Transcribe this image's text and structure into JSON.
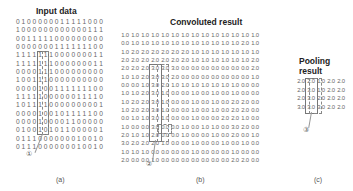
{
  "panels": {
    "a": {
      "title": "Input data",
      "caption": "(a)",
      "marker": "①",
      "rows": [
        "0100000011111000",
        "1000000000000111",
        "0011111000000000",
        "0000000111111100",
        "1111111000000011",
        "1111111000000011",
        "0000111000000000",
        "1001110000000000",
        "0000100111111100",
        "1111100000011110",
        "1011110000000001",
        "0000100101111100",
        "0000100001100000",
        "0100101011000001",
        "0111000000010010",
        "0111000000010010"
      ]
    },
    "b": {
      "title": "Convoluted result",
      "caption": "(b)",
      "marker": "②",
      "rows": [
        [
          "1.0",
          "1.0",
          "1.0",
          "1.0",
          "1.0",
          "1.0",
          "1.0",
          "1.0",
          "1.0",
          "1.0",
          "1.0",
          "1.0",
          "1.0",
          "1.0"
        ],
        [
          "0.0",
          "1.0",
          "1.0",
          "1.0",
          "1.0",
          "1.0",
          "1.0",
          "1.0",
          "1.0",
          "1.0",
          "1.0",
          "1.0",
          "2.0",
          "1.0"
        ],
        [
          "1.0",
          "2.0",
          "2.0",
          "2.0",
          "2.0",
          "2.0",
          "2.0",
          "1.0",
          "1.0",
          "1.0",
          "1.0",
          "1.0",
          "1.0",
          "1.0"
        ],
        [
          "2.0",
          "2.0",
          "2.0",
          "2.0",
          "2.0",
          "2.0",
          "2.0",
          "1.0",
          "1.0",
          "1.0",
          "1.0",
          "1.0",
          "1.0",
          "2.0"
        ],
        [
          "2.0",
          "2.0",
          "2.0",
          "3.0",
          "3.0",
          "3.0",
          "0.0",
          "0.0",
          "0.0",
          "0.0",
          "0.0",
          "0.0",
          "0.0",
          "2.0"
        ],
        [
          "1.0",
          "1.0",
          "2.0",
          "3.0",
          "3.0",
          "2.0",
          "0.0",
          "0.0",
          "0.0",
          "0.0",
          "0.0",
          "0.0",
          "0.0",
          "1.0"
        ],
        [
          "0.0",
          "0.0",
          "1.0",
          "3.0",
          "2.0",
          "1.0",
          "1.0",
          "1.0",
          "1.0",
          "1.0",
          "1.0",
          "1.0",
          "0.0",
          "0.0"
        ],
        [
          "1.0",
          "1.0",
          "2.0",
          "3.0",
          "1.0",
          "0.0",
          "0.0",
          "1.0",
          "0.0",
          "1.0",
          "0.0",
          "1.0",
          "0.0",
          "0.0"
        ],
        [
          "1.0",
          "2.0",
          "2.0",
          "3.0",
          "1.0",
          "0.0",
          "0.0",
          "1.0",
          "0.0",
          "1.0",
          "0.0",
          "2.0",
          "2.0",
          "0.0"
        ],
        [
          "1.0",
          "2.0",
          "2.0",
          "3.0",
          "1.0",
          "0.0",
          "0.0",
          "1.0",
          "0.0",
          "1.0",
          "0.0",
          "2.0",
          "2.0",
          "0.0"
        ],
        [
          "0.0",
          "1.0",
          "1.0",
          "3.0",
          "1.0",
          "0.0",
          "0.0",
          "1.0",
          "0.0",
          "0.0",
          "2.0",
          "2.0",
          "1.0",
          "0.0"
        ],
        [
          "1.0",
          "0.0",
          "0.0",
          "3.0",
          "0.0",
          "0.0",
          "1.0",
          "0.0",
          "1.0",
          "1.0",
          "0.0",
          "3.0",
          "2.0",
          "0.0"
        ],
        [
          "2.0",
          "1.0",
          "1.0",
          "2.0",
          "0.0",
          "0.0",
          "1.0",
          "0.0",
          "0.0",
          "1.0",
          "0.0",
          "2.0",
          "0.0",
          "1.0"
        ],
        [
          "3.0",
          "2.0",
          "2.0",
          "2.0",
          "1.0",
          "0.0",
          "0.0",
          "1.0",
          "0.0",
          "0.0",
          "1.0",
          "0.0",
          "1.0",
          "0.0"
        ],
        [
          "1.0",
          "1.0",
          "1.0",
          "0.0",
          "0.0",
          "0.0",
          "0.0",
          "1.0",
          "0.0",
          "0.0",
          "0.0",
          "1.0",
          "0.0",
          "0.0"
        ],
        [
          "2.0",
          "0.0",
          "0.0",
          "1.0",
          "0.0",
          "0.0",
          "0.0",
          "0.0",
          "0.0",
          "0.0",
          "0.0",
          "2.0",
          "2.0",
          "0.0"
        ]
      ]
    },
    "c": {
      "title_line1": "Pooling",
      "title_line2": "result",
      "caption": "(c)",
      "marker": "③",
      "rows": [
        [
          "2.0",
          "2.0",
          "1.0",
          "2.0",
          "2.0"
        ],
        [
          "2.0",
          "3.0",
          "1.0",
          "2.0",
          "2.0"
        ],
        [
          "2.0",
          "3.0",
          "2.0",
          "2.0",
          "2.0"
        ],
        [
          "3.0",
          "3.0",
          "3.0",
          "2.0",
          "2.0"
        ]
      ]
    }
  }
}
